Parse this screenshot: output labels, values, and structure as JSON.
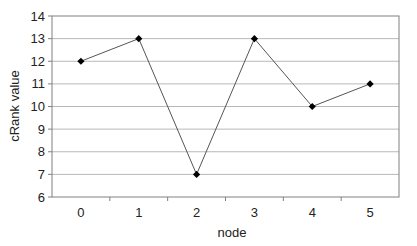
{
  "chart_data": {
    "type": "line",
    "title": "",
    "xlabel": "node",
    "ylabel": "cRank value",
    "categories": [
      "0",
      "1",
      "2",
      "3",
      "4",
      "5"
    ],
    "series": [
      {
        "name": "cRank value",
        "values": [
          12,
          13,
          7,
          13,
          10,
          11
        ]
      }
    ],
    "ylim": [
      6,
      14
    ],
    "yticks": [
      6,
      7,
      8,
      9,
      10,
      11,
      12,
      13,
      14
    ],
    "grid": {
      "horizontal": true,
      "vertical": false
    },
    "legend": null,
    "marker": "diamond",
    "colors": {
      "line": "#555555",
      "marker": "#000000",
      "grid": "#b8b8b8",
      "axis": "#808080"
    }
  }
}
